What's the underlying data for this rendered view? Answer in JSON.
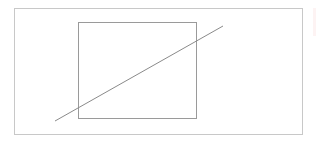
{
  "canvas": {
    "width": 316,
    "height": 148,
    "background": "#ffffff"
  },
  "shapes": {
    "outer_rect": {
      "x": 14,
      "y": 8,
      "width": 288,
      "height": 126,
      "stroke": "#c8c8c8"
    },
    "inner_rect": {
      "x": 78,
      "y": 22,
      "width": 118,
      "height": 96,
      "stroke": "#9a9a9a"
    },
    "diagonal_line": {
      "x1": 55,
      "y1": 121,
      "x2": 223,
      "y2": 26,
      "stroke": "#8a8a8a"
    }
  }
}
